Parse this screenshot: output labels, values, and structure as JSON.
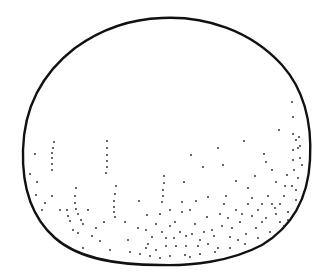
{
  "image": {
    "subject": "Stippled sphere line drawing",
    "stroke_color": "#111111",
    "background": "#ffffff",
    "dot_color": "#222222",
    "outline_path": "M 162 18 C 205 16 250 30 282 65 C 306 92 312 125 310 160 C 308 200 290 228 262 245 C 230 262 190 266 160 265 C 120 265 80 260 55 238 C 30 216 22 185 23 150 C 24 110 40 75 75 48 C 100 30 130 19 162 18 Z",
    "dots": [
      [
        35,
        154
      ],
      [
        30,
        174
      ],
      [
        37,
        182
      ],
      [
        36,
        195
      ],
      [
        45,
        203
      ],
      [
        42,
        210
      ],
      [
        52,
        196
      ],
      [
        60,
        210
      ],
      [
        70,
        221
      ],
      [
        78,
        233
      ],
      [
        92,
        236
      ],
      [
        100,
        241
      ],
      [
        83,
        248
      ],
      [
        110,
        250
      ],
      [
        130,
        252
      ],
      [
        140,
        254
      ],
      [
        150,
        256
      ],
      [
        160,
        258
      ],
      [
        170,
        256
      ],
      [
        185,
        255
      ],
      [
        200,
        254
      ],
      [
        215,
        252
      ],
      [
        230,
        248
      ],
      [
        245,
        244
      ],
      [
        258,
        238
      ],
      [
        54,
        142
      ],
      [
        53,
        148
      ],
      [
        52,
        153
      ],
      [
        52,
        158
      ],
      [
        52,
        164
      ],
      [
        52,
        170
      ],
      [
        107,
        141
      ],
      [
        107,
        148
      ],
      [
        107,
        155
      ],
      [
        107,
        161
      ],
      [
        107,
        167
      ],
      [
        106,
        173
      ],
      [
        76,
        188
      ],
      [
        75,
        196
      ],
      [
        75,
        203
      ],
      [
        76,
        209
      ],
      [
        78,
        214
      ],
      [
        81,
        220
      ],
      [
        83,
        224
      ],
      [
        116,
        186
      ],
      [
        115,
        194
      ],
      [
        114,
        201
      ],
      [
        114,
        207
      ],
      [
        114,
        212
      ],
      [
        115,
        217
      ],
      [
        164,
        176
      ],
      [
        164,
        183
      ],
      [
        163,
        190
      ],
      [
        163,
        196
      ],
      [
        162,
        202
      ],
      [
        67,
        210
      ],
      [
        68,
        216
      ],
      [
        73,
        230
      ],
      [
        88,
        210
      ],
      [
        96,
        228
      ],
      [
        104,
        222
      ],
      [
        125,
        222
      ],
      [
        128,
        240
      ],
      [
        138,
        228
      ],
      [
        147,
        215
      ],
      [
        139,
        201
      ],
      [
        146,
        248
      ],
      [
        152,
        237
      ],
      [
        162,
        232
      ],
      [
        170,
        226
      ],
      [
        176,
        246
      ],
      [
        182,
        212
      ],
      [
        186,
        236
      ],
      [
        195,
        224
      ],
      [
        190,
        257
      ],
      [
        200,
        240
      ],
      [
        207,
        217
      ],
      [
        212,
        230
      ],
      [
        218,
        248
      ],
      [
        222,
        226
      ],
      [
        230,
        237
      ],
      [
        236,
        210
      ],
      [
        240,
        222
      ],
      [
        246,
        234
      ],
      [
        252,
        216
      ],
      [
        256,
        228
      ],
      [
        262,
        204
      ],
      [
        266,
        218
      ],
      [
        270,
        232
      ],
      [
        275,
        208
      ],
      [
        280,
        222
      ],
      [
        284,
        196
      ],
      [
        288,
        212
      ],
      [
        292,
        186
      ],
      [
        296,
        200
      ],
      [
        191,
        155
      ],
      [
        203,
        167
      ],
      [
        223,
        165
      ],
      [
        218,
        148
      ],
      [
        244,
        141
      ],
      [
        236,
        181
      ],
      [
        184,
        182
      ],
      [
        196,
        201
      ],
      [
        208,
        197
      ],
      [
        226,
        196
      ],
      [
        248,
        188
      ],
      [
        255,
        176
      ],
      [
        264,
        154
      ],
      [
        266,
        162
      ],
      [
        272,
        170
      ],
      [
        276,
        182
      ],
      [
        279,
        130
      ],
      [
        292,
        102
      ],
      [
        293,
        117
      ],
      [
        293,
        134
      ],
      [
        296,
        140
      ],
      [
        298,
        148
      ],
      [
        300,
        158
      ],
      [
        302,
        165
      ],
      [
        298,
        178
      ],
      [
        296,
        190
      ],
      [
        299,
        137
      ],
      [
        300,
        146
      ],
      [
        293,
        150
      ],
      [
        293,
        160
      ],
      [
        294,
        170
      ],
      [
        287,
        175
      ],
      [
        285,
        186
      ],
      [
        170,
        210
      ],
      [
        175,
        222
      ],
      [
        180,
        232
      ],
      [
        186,
        246
      ],
      [
        192,
        234
      ],
      [
        198,
        246
      ],
      [
        204,
        232
      ],
      [
        208,
        244
      ],
      [
        214,
        236
      ],
      [
        220,
        214
      ],
      [
        224,
        204
      ],
      [
        228,
        218
      ],
      [
        232,
        228
      ],
      [
        238,
        240
      ],
      [
        242,
        214
      ],
      [
        248,
        204
      ],
      [
        252,
        198
      ],
      [
        258,
        210
      ],
      [
        262,
        222
      ],
      [
        268,
        196
      ],
      [
        272,
        204
      ],
      [
        276,
        214
      ],
      [
        280,
        204
      ],
      [
        284,
        226
      ],
      [
        288,
        220
      ],
      [
        148,
        244
      ],
      [
        156,
        250
      ],
      [
        166,
        246
      ],
      [
        174,
        238
      ],
      [
        146,
        230
      ],
      [
        156,
        224
      ],
      [
        160,
        214
      ],
      [
        166,
        238
      ],
      [
        182,
        202
      ],
      [
        190,
        210
      ]
    ]
  }
}
